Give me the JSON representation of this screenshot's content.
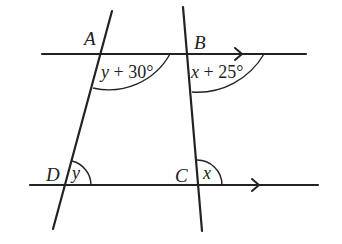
{
  "diagram": {
    "points": {
      "A": "A",
      "B": "B",
      "C": "C",
      "D": "D"
    },
    "angles": {
      "A": {
        "var": "y",
        "rest": " + 30°"
      },
      "B": {
        "var": "x",
        "rest": " + 25°"
      },
      "D": {
        "var": "y"
      },
      "C": {
        "var": "x"
      }
    },
    "colors": {
      "stroke": "#222222",
      "background": "#ffffff"
    }
  }
}
